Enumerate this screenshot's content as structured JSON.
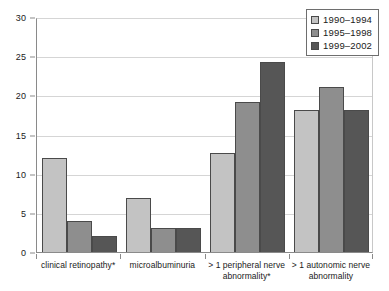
{
  "chart_data": {
    "type": "bar",
    "title": "",
    "xlabel": "",
    "ylabel": "",
    "ylim": [
      0,
      30
    ],
    "yticks": [
      0,
      5,
      10,
      15,
      20,
      25,
      30
    ],
    "ytick_labels": [
      "0",
      "5",
      "10",
      "15",
      "20",
      "25",
      "30"
    ],
    "grid": true,
    "legend_position": "top-right",
    "categories": [
      "clinical retinopathy*",
      "microalbuminuria",
      "> 1 peripheral nerve abnormality*",
      "> 1 autonomic nerve abnormality"
    ],
    "category_lines": [
      [
        "clinical retinopathy*"
      ],
      [
        "microalbuminuria"
      ],
      [
        "> 1 peripheral nerve",
        "abnormality*"
      ],
      [
        "> 1 autonomic nerve",
        "abnormality"
      ]
    ],
    "series": [
      {
        "name": "1990–1994",
        "color": "#c3c3c3",
        "values": [
          12.0,
          6.9,
          12.6,
          18.1
        ]
      },
      {
        "name": "1995–1998",
        "color": "#8e8e8e",
        "values": [
          4.0,
          3.1,
          19.1,
          21.1
        ]
      },
      {
        "name": "1999–2002",
        "color": "#565656",
        "values": [
          2.0,
          3.1,
          24.2,
          18.1
        ]
      }
    ]
  },
  "legend": {
    "items": [
      {
        "label": "1990–1994"
      },
      {
        "label": "1995–1998"
      },
      {
        "label": "1999–2002"
      }
    ]
  },
  "axis": {
    "y_ticks": [
      "30",
      "25",
      "20",
      "15",
      "10",
      "5",
      "0"
    ]
  }
}
